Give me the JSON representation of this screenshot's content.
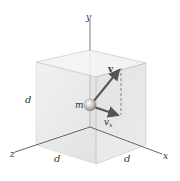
{
  "figure": {
    "axes": {
      "x_label": "x",
      "y_label": "y",
      "z_label": "z"
    },
    "labels": {
      "mass": "m",
      "velocity": "v",
      "velocity_x": "v",
      "velocity_x_subscript": "x",
      "side_left": "d",
      "side_bottom_front": "d",
      "side_bottom_right": "d"
    },
    "colors": {
      "cube_face_left": "#e6e6e6",
      "cube_face_top": "#f2f2f2",
      "cube_face_right": "#dcdcdc",
      "arrow": "#555555",
      "axis": "#666666",
      "sphere": "#b5b5b5"
    }
  }
}
